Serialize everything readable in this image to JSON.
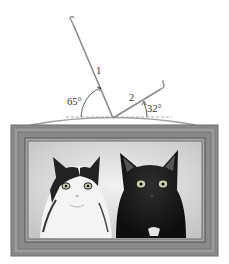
{
  "figure": {
    "wires": [
      {
        "label": "1",
        "angle_label": "65°",
        "angle_deg": 65
      },
      {
        "label": "2",
        "angle_label": "32°",
        "angle_deg": 32
      }
    ],
    "picture": {
      "subjects": [
        "black-and-white cat",
        "black cat"
      ]
    },
    "colors": {
      "wire": "#8a8a8a",
      "frame_outer": "#7d7d7d",
      "frame_mid": "#9a9a9a",
      "frame_inner": "#6a6a6a",
      "background": "#ffffff",
      "photo_bg": "#d8d8d8"
    }
  }
}
